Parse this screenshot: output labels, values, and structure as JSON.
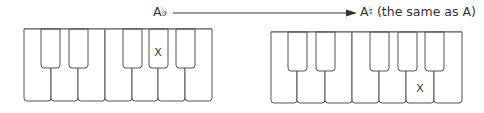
{
  "labels": {
    "from_note": "A♭",
    "to_note": "A♮ (the same as A)"
  },
  "arrow": {
    "x1": 173,
    "x2": 357,
    "y": 13,
    "color": "#333333"
  },
  "keyboards": [
    {
      "name": "left",
      "x": 24,
      "y": 29,
      "width": 188,
      "height": 72,
      "black_key_height": 39,
      "white_dividers": [
        51,
        78,
        105,
        132,
        158,
        185
      ],
      "black_keys": [
        [
          41,
          60
        ],
        [
          69,
          88
        ],
        [
          123,
          142
        ],
        [
          149,
          168
        ],
        [
          176,
          195
        ]
      ],
      "marked_key": {
        "type": "black",
        "index": 3,
        "mark": "X",
        "x": 158,
        "y": 56
      }
    },
    {
      "name": "right",
      "x": 271,
      "y": 32,
      "width": 191,
      "height": 71,
      "black_key_height": 39,
      "white_dividers": [
        297,
        325,
        352,
        379,
        406,
        434
      ],
      "black_keys": [
        [
          288,
          307
        ],
        [
          316,
          335
        ],
        [
          370,
          389
        ],
        [
          398,
          417
        ],
        [
          425,
          444
        ]
      ],
      "marked_key": {
        "type": "white",
        "index": 5,
        "mark": "X",
        "x": 420,
        "y": 92
      }
    }
  ],
  "stroke_color": "#555555"
}
